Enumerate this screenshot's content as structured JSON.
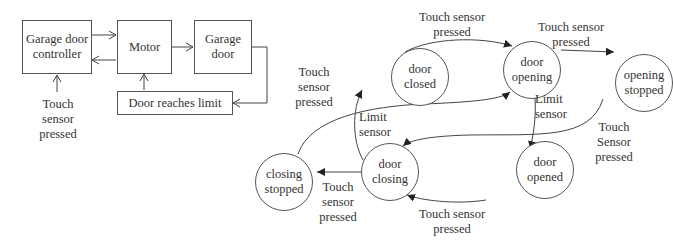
{
  "block_diagram": {
    "boxes": {
      "controller": "Garage door controller",
      "motor": "Motor",
      "garage_door": "Garage door",
      "limit": "Door reaches limit"
    },
    "input_label": "Touch\nsensor\npressed",
    "edges": [
      {
        "from": "controller",
        "to": "motor"
      },
      {
        "from": "motor",
        "to": "controller"
      },
      {
        "from": "motor",
        "to": "garage_door"
      },
      {
        "from": "garage_door",
        "to": "limit"
      },
      {
        "from": "limit",
        "to": "motor"
      },
      {
        "from": "input",
        "to": "controller"
      }
    ]
  },
  "state_machine": {
    "states": {
      "door_closed": "door closed",
      "door_opening": "door opening",
      "opening_stopped": "opening stopped",
      "closing_stopped": "closing stopped",
      "door_closing": "door closing",
      "door_opened": "door opened"
    },
    "transitions": [
      {
        "from": "door_closed",
        "to": "door_opening",
        "label": "Touch sensor\npressed"
      },
      {
        "from": "door_opening",
        "to": "opening_stopped",
        "label": "Touch sensor\npressed"
      },
      {
        "from": "door_opening",
        "to": "door_opened",
        "label": "Limit\nsensor"
      },
      {
        "from": "opening_stopped",
        "to": "door_closing",
        "label": "Touch\nSensor\npressed"
      },
      {
        "from": "door_opened",
        "to": "door_closing",
        "label": "Touch sensor\npressed"
      },
      {
        "from": "door_closing",
        "to": "closing_stopped",
        "label": "Touch\nsensor\npressed"
      },
      {
        "from": "closing_stopped",
        "to": "door_opening",
        "label": "Touch\nsensor\npressed"
      },
      {
        "from": "door_closing",
        "to": "door_closed",
        "label": "Limit\nsensor"
      }
    ]
  }
}
